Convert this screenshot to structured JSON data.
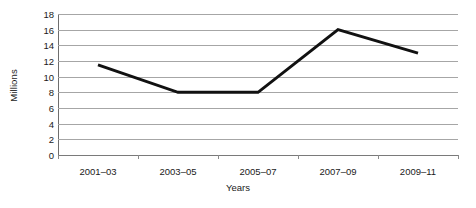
{
  "chart_data": {
    "type": "line",
    "title": "",
    "xlabel": "Years",
    "ylabel": "Millions",
    "categories": [
      "2001–03",
      "2003–05",
      "2005–07",
      "2007–09",
      "2009–11"
    ],
    "values": [
      11.5,
      8,
      8,
      16,
      13
    ],
    "series": [
      {
        "name": "",
        "values": [
          11.5,
          8,
          8,
          16,
          13
        ]
      }
    ],
    "ylim": [
      0,
      18
    ],
    "ytick_values": [
      0,
      2,
      4,
      6,
      8,
      10,
      12,
      14,
      16,
      18
    ],
    "ytick_labels": [
      "0",
      "2",
      "4",
      "6",
      "8",
      "10",
      "12",
      "14",
      "16",
      "18"
    ],
    "grid": true,
    "grid_axis": "y",
    "legend": false,
    "legend_position": "none",
    "line_color": "#111111",
    "line_width": 3,
    "markers": false,
    "background_color": "#ffffff",
    "gridline_color": "#a6a6a6",
    "axis_color": "#6e6e6e"
  }
}
